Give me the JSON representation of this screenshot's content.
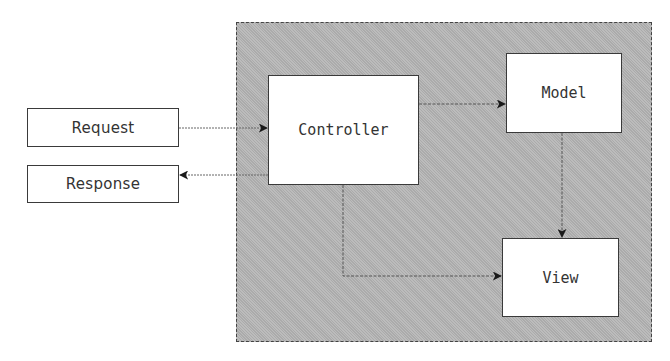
{
  "diagram": {
    "container": {
      "label": "Application",
      "fill": "#b4b4b4"
    },
    "nodes": [
      {
        "id": "request",
        "label": "Request"
      },
      {
        "id": "response",
        "label": "Response"
      },
      {
        "id": "controller",
        "label": "Controller"
      },
      {
        "id": "model",
        "label": "Model"
      },
      {
        "id": "view",
        "label": "View"
      }
    ],
    "edges": [
      {
        "from": "request",
        "to": "controller"
      },
      {
        "from": "controller",
        "to": "response"
      },
      {
        "from": "controller",
        "to": "model"
      },
      {
        "from": "model",
        "to": "view"
      },
      {
        "from": "controller",
        "to": "view"
      }
    ]
  }
}
